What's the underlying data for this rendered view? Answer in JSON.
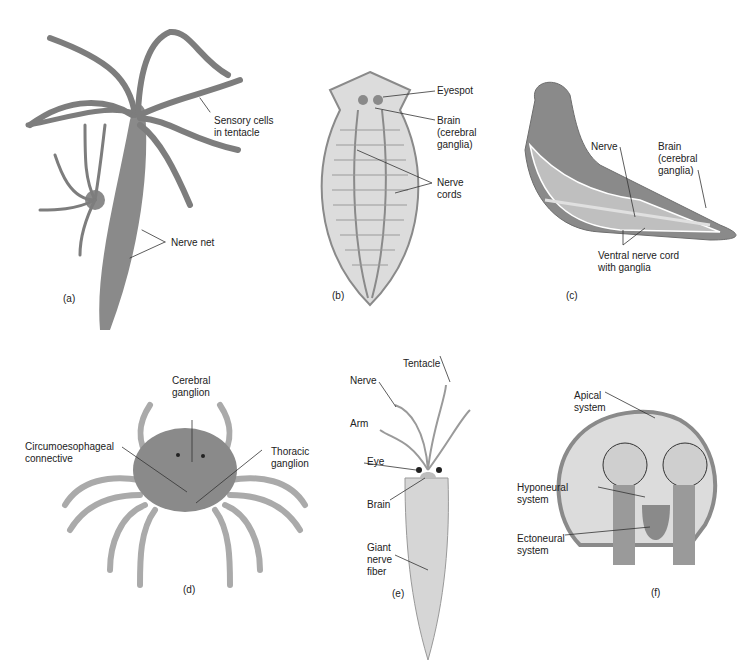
{
  "figure": {
    "panels": [
      {
        "id": "a",
        "letter": "(a)",
        "organism": "hydra",
        "labels": [
          "Sensory cells\nin tentacle",
          "Nerve net"
        ]
      },
      {
        "id": "b",
        "letter": "(b)",
        "organism": "flatworm",
        "labels": [
          "Eyespot",
          "Brain\n(cerebral\nganglia)",
          "Nerve\ncords"
        ]
      },
      {
        "id": "c",
        "letter": "(c)",
        "organism": "earthworm",
        "labels": [
          "Nerve",
          "Brain\n(cerebral\nganglia)",
          "Ventral nerve cord\nwith ganglia"
        ]
      },
      {
        "id": "d",
        "letter": "(d)",
        "organism": "crab",
        "labels": [
          "Cerebral\nganglion",
          "Circumoesophageal\nconnective",
          "Thoracic\nganglion"
        ]
      },
      {
        "id": "e",
        "letter": "(e)",
        "organism": "squid",
        "labels": [
          "Tentacle",
          "Nerve",
          "Arm",
          "Eye",
          "Brain",
          "Giant\nnerve\nfiber"
        ]
      },
      {
        "id": "f",
        "letter": "(f)",
        "organism": "sea star",
        "labels": [
          "Apical\nsystem",
          "Hyponeural\nsystem",
          "Ectoneural\nsystem"
        ]
      }
    ],
    "colors": {
      "body": "#8a8a8a",
      "light": "#d8d8d8",
      "line": "#333333",
      "outline": "#6e6e6e"
    }
  }
}
